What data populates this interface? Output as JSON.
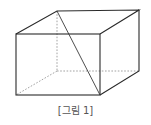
{
  "figure": {
    "caption": "[그림 1]",
    "shape": "rectangular-prism",
    "colors": {
      "edge": "#2a2a2a",
      "hidden_edge": "#8a8a8a",
      "caption": "#555555",
      "background": "#ffffff"
    },
    "vertices": {
      "front_top_left": [
        16,
        34
      ],
      "front_top_right": [
        100,
        34
      ],
      "front_bottom_left": [
        16,
        95
      ],
      "front_bottom_right": [
        100,
        95
      ],
      "back_top_left": [
        57,
        11
      ],
      "back_top_right": [
        139,
        10
      ],
      "back_bottom_left": [
        57,
        71
      ],
      "back_bottom_right": [
        139,
        71
      ]
    },
    "visible_edges": [
      [
        "front_top_left",
        "front_top_right"
      ],
      [
        "front_top_right",
        "front_bottom_right"
      ],
      [
        "front_bottom_right",
        "front_bottom_left"
      ],
      [
        "front_bottom_left",
        "front_top_left"
      ],
      [
        "front_top_left",
        "back_top_left"
      ],
      [
        "back_top_left",
        "back_top_right"
      ],
      [
        "front_top_right",
        "back_top_right"
      ],
      [
        "back_top_right",
        "back_bottom_right"
      ],
      [
        "front_bottom_right",
        "back_bottom_right"
      ]
    ],
    "hidden_edges": [
      [
        "back_top_left",
        "back_bottom_left"
      ],
      [
        "back_bottom_left",
        "back_bottom_right"
      ],
      [
        "back_bottom_left",
        "front_bottom_left"
      ]
    ],
    "diagonal": [
      "back_top_left",
      "front_bottom_right"
    ]
  }
}
